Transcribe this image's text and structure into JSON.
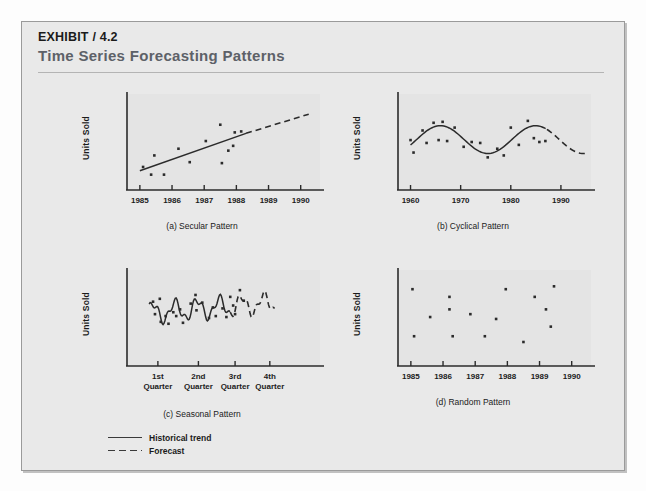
{
  "exhibit": {
    "kicker": "EXHIBIT / 4.2",
    "title": "Time Series Forecasting Patterns"
  },
  "legend": {
    "items": [
      {
        "label": "Historical trend",
        "style": "solid",
        "color": "#3a3a3a"
      },
      {
        "label": "Forecast",
        "style": "dashed",
        "color": "#3a3a3a"
      }
    ]
  },
  "colors": {
    "panel_background": "#e9e9e9",
    "plot_background": "#e4e4e4",
    "axis": "#2b2b2b",
    "ink": "#1b1b1b",
    "title_gray": "#5d6168",
    "rule": "#b4b4b4"
  },
  "chart_data": [
    {
      "id": "a",
      "type": "scatter",
      "title": "(a) Secular Pattern",
      "xlabel": "",
      "ylabel": "Units Sold",
      "xticklabels": [
        "1985",
        "1986",
        "1987",
        "1988",
        "1989",
        "1990"
      ],
      "xlim": [
        1984.6,
        1990.6
      ],
      "ylim": [
        0,
        10
      ],
      "grid": false,
      "points": [
        {
          "x": 1985.1,
          "y": 2.4
        },
        {
          "x": 1985.35,
          "y": 1.6
        },
        {
          "x": 1985.45,
          "y": 3.6
        },
        {
          "x": 1985.75,
          "y": 1.6
        },
        {
          "x": 1986.2,
          "y": 4.3
        },
        {
          "x": 1986.55,
          "y": 2.9
        },
        {
          "x": 1987.05,
          "y": 5.1
        },
        {
          "x": 1987.5,
          "y": 6.8
        },
        {
          "x": 1987.55,
          "y": 2.8
        },
        {
          "x": 1987.75,
          "y": 4.1
        },
        {
          "x": 1987.9,
          "y": 4.6
        },
        {
          "x": 1987.95,
          "y": 6.0
        },
        {
          "x": 1988.15,
          "y": 6.1
        }
      ],
      "trend_solid": {
        "x0": 1985.0,
        "y0": 2.0,
        "x1": 1988.3,
        "y1": 5.9
      },
      "trend_dashed": {
        "x0": 1988.3,
        "y0": 5.9,
        "x1": 1990.25,
        "y1": 7.9
      }
    },
    {
      "id": "b",
      "type": "scatter",
      "title": "(b) Cyclical  Pattern",
      "xlabel": "",
      "ylabel": "Units Sold",
      "xticklabels": [
        "1960",
        "1970",
        "1980",
        "1990"
      ],
      "xlim": [
        1957.5,
        1996.0
      ],
      "ylim": [
        0,
        10
      ],
      "grid": false,
      "points": [
        {
          "x": 1960.0,
          "y": 5.2
        },
        {
          "x": 1960.6,
          "y": 3.9
        },
        {
          "x": 1962.4,
          "y": 6.2
        },
        {
          "x": 1963.2,
          "y": 4.9
        },
        {
          "x": 1964.6,
          "y": 7.0
        },
        {
          "x": 1965.6,
          "y": 5.2
        },
        {
          "x": 1966.4,
          "y": 7.1
        },
        {
          "x": 1967.3,
          "y": 5.1
        },
        {
          "x": 1968.8,
          "y": 6.5
        },
        {
          "x": 1970.6,
          "y": 4.5
        },
        {
          "x": 1972.2,
          "y": 5.0
        },
        {
          "x": 1973.9,
          "y": 4.9
        },
        {
          "x": 1975.4,
          "y": 3.4
        },
        {
          "x": 1977.3,
          "y": 4.3
        },
        {
          "x": 1978.6,
          "y": 3.6
        },
        {
          "x": 1980.0,
          "y": 6.5
        },
        {
          "x": 1981.6,
          "y": 4.7
        },
        {
          "x": 1983.4,
          "y": 7.2
        },
        {
          "x": 1984.6,
          "y": 5.4
        },
        {
          "x": 1985.7,
          "y": 5.0
        },
        {
          "x": 1986.9,
          "y": 5.1
        }
      ]
    },
    {
      "id": "c",
      "type": "scatter",
      "title": "(c) Seasonal Pattern",
      "xlabel": "",
      "ylabel": "Units Sold",
      "xticklabels": [
        "1st\nQuarter",
        "2nd\nQuarter",
        "3rd\nQuarter",
        "4th\nQuarter"
      ],
      "xlim": [
        0,
        10
      ],
      "ylim": [
        0,
        10
      ],
      "grid": false,
      "points": [
        {
          "x": 1.35,
          "y": 6.7
        },
        {
          "x": 1.45,
          "y": 5.4
        },
        {
          "x": 1.7,
          "y": 7.0
        },
        {
          "x": 1.75,
          "y": 4.6
        },
        {
          "x": 2.0,
          "y": 5.2
        },
        {
          "x": 2.15,
          "y": 4.4
        },
        {
          "x": 2.4,
          "y": 5.6
        },
        {
          "x": 2.55,
          "y": 5.2
        },
        {
          "x": 2.75,
          "y": 5.9
        },
        {
          "x": 2.9,
          "y": 4.5
        },
        {
          "x": 3.3,
          "y": 6.5
        },
        {
          "x": 3.55,
          "y": 7.4
        },
        {
          "x": 3.6,
          "y": 5.8
        },
        {
          "x": 3.9,
          "y": 6.6
        },
        {
          "x": 4.25,
          "y": 5.0
        },
        {
          "x": 4.45,
          "y": 6.1
        },
        {
          "x": 4.6,
          "y": 5.2
        },
        {
          "x": 4.95,
          "y": 6.0
        },
        {
          "x": 5.15,
          "y": 5.1
        },
        {
          "x": 5.35,
          "y": 7.2
        },
        {
          "x": 5.5,
          "y": 6.3
        },
        {
          "x": 5.6,
          "y": 5.4
        },
        {
          "x": 5.85,
          "y": 7.9
        },
        {
          "x": 6.05,
          "y": 6.8
        }
      ]
    },
    {
      "id": "d",
      "type": "scatter",
      "title": "(d) Random Pattern",
      "xlabel": "",
      "ylabel": "Units Sold",
      "xticklabels": [
        "1985",
        "1986",
        "1987",
        "1988",
        "1989",
        "1990"
      ],
      "xlim": [
        1984.6,
        1990.6
      ],
      "ylim": [
        0,
        10
      ],
      "grid": false,
      "points": [
        {
          "x": 1985.05,
          "y": 8.0
        },
        {
          "x": 1985.1,
          "y": 3.1
        },
        {
          "x": 1985.6,
          "y": 5.1
        },
        {
          "x": 1986.2,
          "y": 7.2
        },
        {
          "x": 1986.2,
          "y": 5.9
        },
        {
          "x": 1986.3,
          "y": 3.1
        },
        {
          "x": 1986.85,
          "y": 5.4
        },
        {
          "x": 1987.3,
          "y": 3.1
        },
        {
          "x": 1987.65,
          "y": 4.9
        },
        {
          "x": 1987.95,
          "y": 8.0
        },
        {
          "x": 1988.5,
          "y": 2.5
        },
        {
          "x": 1988.85,
          "y": 7.2
        },
        {
          "x": 1989.2,
          "y": 5.9
        },
        {
          "x": 1989.35,
          "y": 4.1
        },
        {
          "x": 1989.45,
          "y": 8.3
        }
      ]
    }
  ]
}
